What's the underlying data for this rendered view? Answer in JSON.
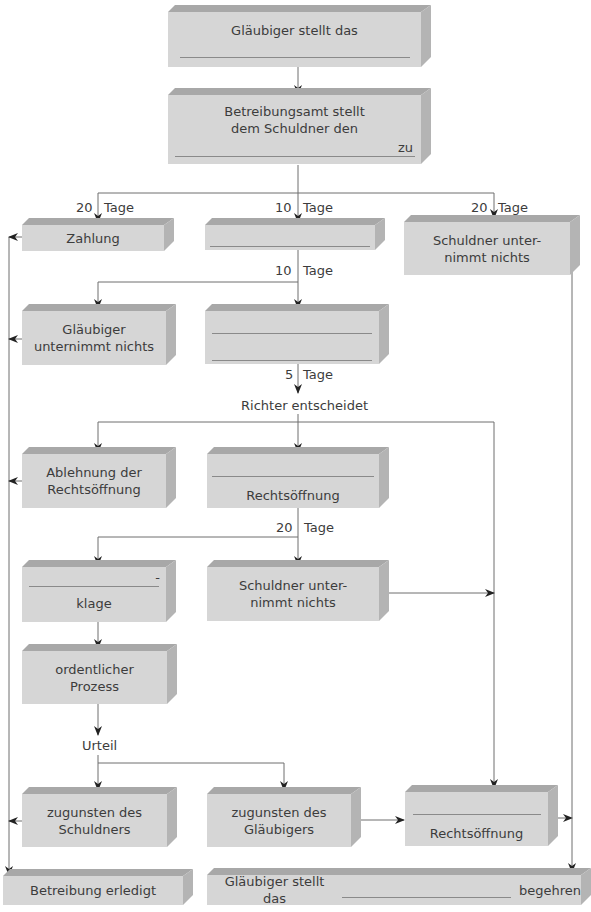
{
  "diagram": {
    "boxes": {
      "b1": {
        "text": "Gläubiger stellt das"
      },
      "b2": {
        "line1": "Betreibungsamt stellt",
        "line2": "dem Schuldner den",
        "suffix": "zu"
      },
      "zahlung": {
        "text": "Zahlung"
      },
      "blank_mid": {
        "text": ""
      },
      "schuldner_right": {
        "line1": "Schuldner unter-",
        "line2": "nimmt nichts"
      },
      "glaeubiger_nichts": {
        "line1": "Gläubiger",
        "line2": "unternimmt nichts"
      },
      "blank_two_lines": {
        "text": ""
      },
      "ablehnung": {
        "line1": "Ablehnung der",
        "line2": "Rechtsöffnung"
      },
      "rechtsoeffnung_mid": {
        "text": "Rechtsöffnung"
      },
      "klage": {
        "dash": "-",
        "text": "klage"
      },
      "schuldner_mid": {
        "line1": "Schuldner unter-",
        "line2": "nimmt nichts"
      },
      "prozess": {
        "line1": "ordentlicher",
        "line2": "Prozess"
      },
      "zug_schuldner": {
        "line1": "zugunsten des",
        "line2": "Schuldners"
      },
      "zug_glaeubiger": {
        "line1": "zugunsten des",
        "line2": "Gläubigers"
      },
      "rechtsoeffnung_right": {
        "text": "Rechtsöffnung"
      },
      "erledigt": {
        "text": "Betreibung erledigt"
      },
      "final": {
        "prefix": "Gläubiger stellt das",
        "suffix": "begehren"
      }
    },
    "labels": {
      "d20_left": {
        "num": "20",
        "unit": "Tage"
      },
      "d10_mid": {
        "num": "10",
        "unit": "Tage"
      },
      "d20_right": {
        "num": "20",
        "unit": "Tage"
      },
      "d10_second": {
        "num": "10",
        "unit": "Tage"
      },
      "d5": {
        "num": "5",
        "unit": "Tage"
      },
      "richter": "Richter entscheidet",
      "d20_third": {
        "num": "20",
        "unit": "Tage"
      },
      "urteil": "Urteil"
    },
    "colors": {
      "face": "#d6d6d6",
      "top": "#a8a8a8",
      "side": "#b4b4b4",
      "line": "#6e6e6e"
    }
  }
}
